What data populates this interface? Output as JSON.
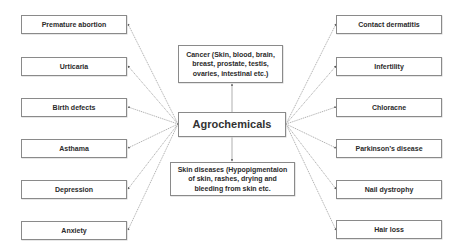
{
  "diagram": {
    "center": {
      "label": "Agrochemicals"
    },
    "top": {
      "label": "Cancer (Skin, blood, brain, breast, prostate, testis, ovaries, intestinal etc.)"
    },
    "bottom": {
      "label": "Skin diseases (Hypopigmentaion of skin, rashes, drying and bleeding from skin etc."
    },
    "left": [
      {
        "label": "Premature abortion"
      },
      {
        "label": "Urticaria"
      },
      {
        "label": "Birth defects"
      },
      {
        "label": "Asthama"
      },
      {
        "label": "Depression"
      },
      {
        "label": "Anxiety"
      }
    ],
    "right": [
      {
        "label": "Contact dermatitis"
      },
      {
        "label": "Infertility"
      },
      {
        "label": "Chloracne"
      },
      {
        "label": "Parkinson’s disease"
      },
      {
        "label": "Nail dystrophy"
      },
      {
        "label": "Hair loss"
      }
    ],
    "colors": {
      "border": "#8a8a8a",
      "line": "#7a7a7a",
      "text": "#2b2b2b"
    }
  }
}
